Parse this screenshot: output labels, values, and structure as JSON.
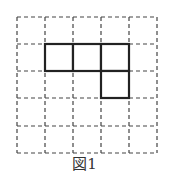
{
  "figure": {
    "caption": "図1",
    "grid": {
      "columns": 5,
      "rows": 5,
      "origin_x": 17,
      "origin_y": 17,
      "x_lines": [
        17,
        45,
        73,
        101,
        129,
        157
      ],
      "y_lines": [
        17,
        44,
        71,
        98,
        126,
        153
      ],
      "line_style": "dashed",
      "line_color": "#444444"
    },
    "shape": {
      "description": "bold polyomino of 4 squares: three in a row plus one below the rightmost",
      "cells": [
        {
          "row": 1,
          "col": 1
        },
        {
          "row": 1,
          "col": 2
        },
        {
          "row": 1,
          "col": 3
        },
        {
          "row": 2,
          "col": 3
        }
      ],
      "line_color": "#222222"
    }
  }
}
